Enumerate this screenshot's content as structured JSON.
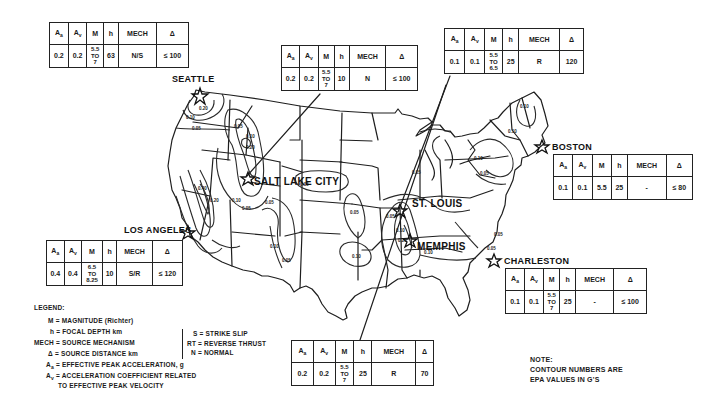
{
  "map": {
    "title": "",
    "region": "Contiguous United States",
    "contour_values_label": "EPA values in g's"
  },
  "cities": [
    {
      "name": "SEATTLE",
      "table": {
        "Aa": "0.2",
        "Av": "0.2",
        "M": [
          "5.5",
          "TO",
          "7"
        ],
        "h": "63",
        "MECH": "N/S",
        "delta": "≤ 100"
      }
    },
    {
      "name": "SALT LAKE CITY",
      "table": {
        "Aa": "0.2",
        "Av": "0.2",
        "M": [
          "5.5",
          "TO",
          "7"
        ],
        "h": "10",
        "MECH": "N",
        "delta": "≤ 100"
      }
    },
    {
      "name": "ST. LOUIS",
      "table": {
        "Aa": "0.1",
        "Av": "0.1",
        "M": [
          "5.5",
          "TO",
          "6.5"
        ],
        "h": "25",
        "MECH": "R",
        "delta": "120"
      }
    },
    {
      "name": "BOSTON",
      "table": {
        "Aa": "0.1",
        "Av": "0.1",
        "M": [
          "5.5"
        ],
        "h": "25",
        "MECH": "-",
        "delta": "≤ 80"
      }
    },
    {
      "name": "LOS ANGELES",
      "table": {
        "Aa": "0.4",
        "Av": "0.4",
        "M": [
          "6.5",
          "TO",
          "8.25"
        ],
        "h": "10",
        "MECH": "S/R",
        "delta": "≤ 120"
      }
    },
    {
      "name": "MEMPHIS",
      "table": {
        "Aa": "0.2",
        "Av": "0.2",
        "M": [
          "5.5",
          "TO",
          "7"
        ],
        "h": "25",
        "MECH": "R",
        "delta": "70"
      }
    },
    {
      "name": "CHARLESTON",
      "table": {
        "Aa": "0.1",
        "Av": "0.1",
        "M": [
          "5.5",
          "TO",
          "7"
        ],
        "h": "25",
        "MECH": "-",
        "delta": "≤ 100"
      }
    }
  ],
  "table_headers": {
    "Aa": "A",
    "Aa_sub": "a",
    "Av": "A",
    "Av_sub": "v",
    "M": "M",
    "h": "h",
    "MECH": "MECH",
    "delta": "Δ"
  },
  "contour_labels": [
    "0.05",
    "0.10",
    "0.20",
    "0.40"
  ],
  "legend": {
    "title": "LEGEND:",
    "items": [
      {
        "sym": "M",
        "text": "= MAGNITUDE (Richter)"
      },
      {
        "sym": "h",
        "text": "= FOCAL DEPTH km"
      },
      {
        "sym": "MECH",
        "text": "= SOURCE MECHANISM"
      },
      {
        "sym": "Δ",
        "text": "= SOURCE DISTANCE km"
      },
      {
        "sym": "Aa",
        "text": "= EFFECTIVE PEAK ACCELERATION, g"
      },
      {
        "sym": "Av",
        "text": "= ACCELERATION COEFFICIENT RELATED"
      },
      {
        "sym": "",
        "text": "TO EFFECTIVE PEAK VELOCITY"
      }
    ],
    "mechanisms": [
      {
        "code": "S",
        "text": "= STRIKE SLIP"
      },
      {
        "code": "RT",
        "text": "= REVERSE THRUST"
      },
      {
        "code": "N",
        "text": "= NORMAL"
      }
    ]
  },
  "note": {
    "title": "NOTE:",
    "line1": "CONTOUR NUMBERS ARE",
    "line2": "EPA VALUES IN G'S"
  }
}
